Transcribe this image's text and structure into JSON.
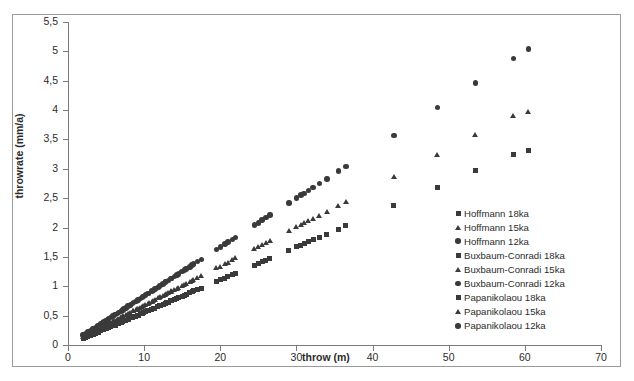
{
  "chart_data": {
    "type": "scatter",
    "title": "",
    "xlabel": "throw (m)",
    "ylabel": "throwrate (mm/a)",
    "xlim": [
      0,
      70
    ],
    "ylim": [
      0,
      5.5
    ],
    "xticks": [
      "0",
      "10",
      "20",
      "30",
      "40",
      "50",
      "60",
      "70"
    ],
    "xtick_values": [
      0,
      10,
      20,
      30,
      40,
      50,
      60,
      70
    ],
    "yticks": [
      "0",
      "0,5",
      "1",
      "1,5",
      "2",
      "2,5",
      "3",
      "3,5",
      "4",
      "4,5",
      "5",
      "5,5"
    ],
    "ytick_values": [
      0,
      0.5,
      1,
      1.5,
      2,
      2.5,
      3,
      3.5,
      4,
      4.5,
      5,
      5.5
    ],
    "grid": false,
    "legend_position": "center-right",
    "decimal_separator": ",",
    "marker_color": "#3a3a3a",
    "axis_color": "#7a7a7a",
    "frame_color": "#9a9a9a",
    "series": [
      {
        "name": "Hoffmann 18ka",
        "marker": "square",
        "x": [
          2.0,
          3.0,
          3.6,
          4.3,
          5.0,
          5.6,
          6.2,
          7.0,
          7.6,
          8.2,
          8.9,
          9.5,
          10.2,
          11.0,
          11.8,
          12.5,
          13.2,
          14.0,
          15.0,
          16.0,
          17.0,
          20.0,
          21.0,
          22.0,
          25.5,
          26.5,
          30.0,
          31.0,
          33.0,
          35.5,
          36.5,
          42.8,
          48.5,
          53.5,
          58.5,
          60.5
        ],
        "y": [
          0.11,
          0.17,
          0.2,
          0.24,
          0.28,
          0.31,
          0.34,
          0.39,
          0.42,
          0.46,
          0.49,
          0.53,
          0.57,
          0.61,
          0.66,
          0.69,
          0.73,
          0.78,
          0.83,
          0.89,
          0.94,
          1.11,
          1.17,
          1.22,
          1.42,
          1.47,
          1.67,
          1.72,
          1.83,
          1.97,
          2.03,
          2.38,
          2.69,
          2.97,
          3.25,
          3.31
        ]
      },
      {
        "name": "Hoffmann 15ka",
        "marker": "triangle",
        "x": [
          2.0,
          3.0,
          3.6,
          4.3,
          5.0,
          5.6,
          6.2,
          7.0,
          7.6,
          8.2,
          8.9,
          9.5,
          10.2,
          11.0,
          11.8,
          12.5,
          13.2,
          14.0,
          15.0,
          16.0,
          17.0,
          20.0,
          21.0,
          22.0,
          25.5,
          26.5,
          30.0,
          31.0,
          33.0,
          35.5,
          36.5,
          42.8,
          48.5,
          53.5,
          58.5,
          60.5
        ],
        "y": [
          0.13,
          0.2,
          0.24,
          0.29,
          0.33,
          0.37,
          0.41,
          0.47,
          0.51,
          0.55,
          0.59,
          0.63,
          0.68,
          0.73,
          0.79,
          0.83,
          0.88,
          0.93,
          1.0,
          1.07,
          1.13,
          1.33,
          1.4,
          1.47,
          1.7,
          1.77,
          2.0,
          2.07,
          2.2,
          2.37,
          2.43,
          2.85,
          3.23,
          3.57,
          3.9,
          3.97
        ]
      },
      {
        "name": "Hoffmann 12ka",
        "marker": "circle",
        "x": [
          2.0,
          3.0,
          3.6,
          4.3,
          5.0,
          5.6,
          6.2,
          7.0,
          7.6,
          8.2,
          8.9,
          9.5,
          10.2,
          11.0,
          11.8,
          12.5,
          13.2,
          14.0,
          15.0,
          16.0,
          17.0,
          20.0,
          21.0,
          22.0,
          25.5,
          26.5,
          30.0,
          31.0,
          33.0,
          35.5,
          36.5,
          42.8,
          48.5,
          53.5,
          58.5,
          60.5
        ],
        "y": [
          0.17,
          0.25,
          0.3,
          0.36,
          0.42,
          0.47,
          0.52,
          0.58,
          0.63,
          0.68,
          0.74,
          0.79,
          0.85,
          0.92,
          0.98,
          1.04,
          1.1,
          1.17,
          1.25,
          1.33,
          1.42,
          1.67,
          1.75,
          1.83,
          2.13,
          2.21,
          2.5,
          2.58,
          2.75,
          2.96,
          3.04,
          3.57,
          4.04,
          4.46,
          4.88,
          5.04
        ]
      },
      {
        "name": "Buxbaum-Conradi 18ka",
        "marker": "square",
        "x": [
          2.6,
          3.3,
          4.0,
          4.7,
          5.3,
          6.0,
          6.6,
          7.3,
          8.0,
          8.6,
          9.2,
          9.9,
          10.6,
          11.4,
          12.1,
          12.9,
          13.6,
          14.5,
          15.5,
          16.5,
          20.6,
          21.6,
          25.0,
          26.0,
          30.6,
          31.6,
          34.0
        ],
        "y": [
          0.14,
          0.18,
          0.22,
          0.26,
          0.29,
          0.33,
          0.37,
          0.41,
          0.44,
          0.48,
          0.51,
          0.55,
          0.59,
          0.63,
          0.67,
          0.72,
          0.76,
          0.81,
          0.86,
          0.92,
          1.14,
          1.2,
          1.39,
          1.44,
          1.7,
          1.76,
          1.89
        ]
      },
      {
        "name": "Buxbaum-Conradi 15ka",
        "marker": "triangle",
        "x": [
          2.6,
          3.3,
          4.0,
          4.7,
          5.3,
          6.0,
          6.6,
          7.3,
          8.0,
          8.6,
          9.2,
          9.9,
          10.6,
          11.4,
          12.1,
          12.9,
          13.6,
          14.5,
          15.5,
          16.5,
          20.6,
          21.6,
          25.0,
          26.0,
          30.6,
          31.6,
          34.0
        ],
        "y": [
          0.17,
          0.22,
          0.27,
          0.31,
          0.35,
          0.4,
          0.44,
          0.49,
          0.53,
          0.57,
          0.61,
          0.66,
          0.71,
          0.76,
          0.81,
          0.86,
          0.91,
          0.97,
          1.03,
          1.1,
          1.37,
          1.44,
          1.67,
          1.73,
          2.04,
          2.11,
          2.27
        ]
      },
      {
        "name": "Buxbaum-Conradi 12ka",
        "marker": "circle",
        "x": [
          2.6,
          3.3,
          4.0,
          4.7,
          5.3,
          6.0,
          6.6,
          7.3,
          8.0,
          8.6,
          9.2,
          9.9,
          10.6,
          11.4,
          12.1,
          12.9,
          13.6,
          14.5,
          15.5,
          16.5,
          20.6,
          21.6,
          25.0,
          26.0,
          30.6,
          31.6,
          34.0
        ],
        "y": [
          0.22,
          0.28,
          0.33,
          0.39,
          0.44,
          0.5,
          0.55,
          0.61,
          0.67,
          0.72,
          0.77,
          0.83,
          0.88,
          0.95,
          1.01,
          1.08,
          1.13,
          1.21,
          1.29,
          1.38,
          1.72,
          1.8,
          2.08,
          2.17,
          2.55,
          2.63,
          2.83
        ]
      },
      {
        "name": "Papanikolaou 18ka",
        "marker": "square",
        "x": [
          2.3,
          3.9,
          4.6,
          5.2,
          5.9,
          6.5,
          7.2,
          7.9,
          8.5,
          9.1,
          9.8,
          10.5,
          11.2,
          12.0,
          12.8,
          13.5,
          14.3,
          15.3,
          16.3,
          17.5,
          19.5,
          24.5,
          29.0,
          32.2
        ],
        "y": [
          0.13,
          0.22,
          0.26,
          0.29,
          0.33,
          0.36,
          0.4,
          0.44,
          0.47,
          0.51,
          0.54,
          0.58,
          0.62,
          0.67,
          0.71,
          0.75,
          0.79,
          0.85,
          0.91,
          0.97,
          1.08,
          1.36,
          1.61,
          1.79
        ]
      },
      {
        "name": "Papanikolaou 15ka",
        "marker": "triangle",
        "x": [
          2.3,
          3.9,
          4.6,
          5.2,
          5.9,
          6.5,
          7.2,
          7.9,
          8.5,
          9.1,
          9.8,
          10.5,
          11.2,
          12.0,
          12.8,
          13.5,
          14.3,
          15.3,
          16.3,
          17.5,
          19.5,
          24.5,
          29.0,
          32.2
        ],
        "y": [
          0.15,
          0.26,
          0.31,
          0.35,
          0.39,
          0.43,
          0.48,
          0.53,
          0.57,
          0.61,
          0.65,
          0.7,
          0.75,
          0.8,
          0.85,
          0.9,
          0.95,
          1.02,
          1.09,
          1.17,
          1.3,
          1.63,
          1.93,
          2.15
        ]
      },
      {
        "name": "Papanikolaou 12ka",
        "marker": "circle",
        "x": [
          2.3,
          3.9,
          4.6,
          5.2,
          5.9,
          6.5,
          7.2,
          7.9,
          8.5,
          9.1,
          9.8,
          10.5,
          11.2,
          12.0,
          12.8,
          13.5,
          14.3,
          15.3,
          16.3,
          17.5,
          19.5,
          24.5,
          29.0,
          32.2
        ],
        "y": [
          0.19,
          0.33,
          0.38,
          0.43,
          0.49,
          0.54,
          0.6,
          0.66,
          0.71,
          0.76,
          0.82,
          0.88,
          0.93,
          1.0,
          1.07,
          1.13,
          1.19,
          1.28,
          1.36,
          1.46,
          1.63,
          2.04,
          2.42,
          2.68
        ]
      }
    ]
  },
  "legend": {
    "items": [
      {
        "label": "Hoffmann 18ka",
        "marker": "square"
      },
      {
        "label": "Hoffmann 15ka",
        "marker": "triangle"
      },
      {
        "label": "Hoffmann 12ka",
        "marker": "circle"
      },
      {
        "label": "Buxbaum-Conradi 18ka",
        "marker": "square"
      },
      {
        "label": "Buxbaum-Conradi 15ka",
        "marker": "triangle"
      },
      {
        "label": "Buxbaum-Conradi 12ka",
        "marker": "circle"
      },
      {
        "label": "Papanikolaou 18ka",
        "marker": "square"
      },
      {
        "label": "Papanikolaou 15ka",
        "marker": "triangle"
      },
      {
        "label": "Papanikolaou 12ka",
        "marker": "circle"
      }
    ]
  }
}
